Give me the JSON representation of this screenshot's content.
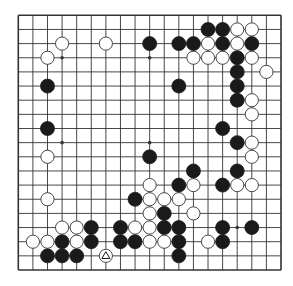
{
  "diagram": {
    "type": "go-board",
    "size": 19,
    "colors": {
      "background": "#ffffff",
      "line": "#333333",
      "black": "#1a1a1a",
      "white": "#ffffff",
      "stone_outline": "#333333"
    },
    "star_points": [
      [
        3,
        3
      ],
      [
        9,
        3
      ],
      [
        15,
        3
      ],
      [
        3,
        9
      ],
      [
        9,
        9
      ],
      [
        15,
        9
      ],
      [
        3,
        15
      ],
      [
        9,
        15
      ],
      [
        15,
        15
      ]
    ],
    "black_stones": [
      [
        13,
        1
      ],
      [
        14,
        1
      ],
      [
        9,
        2
      ],
      [
        11,
        2
      ],
      [
        12,
        2
      ],
      [
        14,
        2
      ],
      [
        16,
        2
      ],
      [
        15,
        3
      ],
      [
        15,
        4
      ],
      [
        2,
        5
      ],
      [
        11,
        5
      ],
      [
        15,
        5
      ],
      [
        15,
        6
      ],
      [
        2,
        8
      ],
      [
        14,
        8
      ],
      [
        15,
        9
      ],
      [
        9,
        10
      ],
      [
        12,
        11
      ],
      [
        15,
        11
      ],
      [
        11,
        12
      ],
      [
        14,
        12
      ],
      [
        8,
        13
      ],
      [
        10,
        14
      ],
      [
        5,
        15
      ],
      [
        7,
        15
      ],
      [
        10,
        15
      ],
      [
        11,
        15
      ],
      [
        14,
        15
      ],
      [
        16,
        15
      ],
      [
        3,
        16
      ],
      [
        5,
        16
      ],
      [
        7,
        16
      ],
      [
        8,
        16
      ],
      [
        11,
        16
      ],
      [
        14,
        16
      ],
      [
        2,
        17
      ],
      [
        3,
        17
      ],
      [
        4,
        17
      ],
      [
        11,
        17
      ]
    ],
    "white_stones": [
      [
        15,
        1
      ],
      [
        16,
        1
      ],
      [
        3,
        2
      ],
      [
        6,
        2
      ],
      [
        13,
        2
      ],
      [
        15,
        2
      ],
      [
        2,
        3
      ],
      [
        12,
        3
      ],
      [
        13,
        3
      ],
      [
        14,
        3
      ],
      [
        16,
        3
      ],
      [
        17,
        4
      ],
      [
        16,
        6
      ],
      [
        16,
        7
      ],
      [
        16,
        9
      ],
      [
        2,
        10
      ],
      [
        16,
        10
      ],
      [
        9,
        12
      ],
      [
        12,
        12
      ],
      [
        15,
        12
      ],
      [
        16,
        12
      ],
      [
        2,
        13
      ],
      [
        9,
        13
      ],
      [
        10,
        13
      ],
      [
        11,
        13
      ],
      [
        9,
        14
      ],
      [
        12,
        14
      ],
      [
        3,
        15
      ],
      [
        4,
        15
      ],
      [
        8,
        15
      ],
      [
        9,
        15
      ],
      [
        1,
        16
      ],
      [
        2,
        16
      ],
      [
        4,
        16
      ],
      [
        9,
        16
      ],
      [
        10,
        16
      ],
      [
        13,
        16
      ],
      [
        6,
        17
      ]
    ],
    "markers": [
      {
        "type": "triangle",
        "col": 6,
        "row": 17,
        "on": "white"
      }
    ]
  }
}
